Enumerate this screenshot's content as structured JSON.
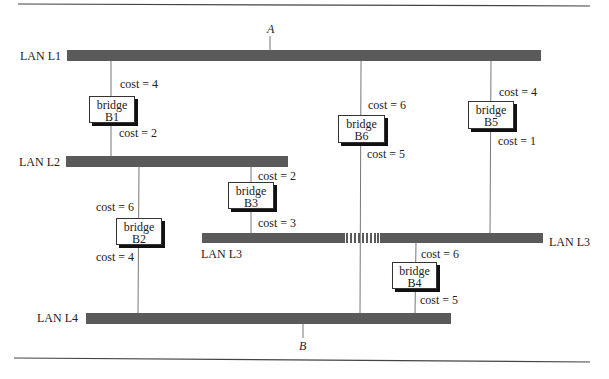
{
  "diagram": {
    "endpoints": {
      "a": "A",
      "b": "B"
    },
    "lans": [
      {
        "id": "L1",
        "label": "LAN L1"
      },
      {
        "id": "L2",
        "label": "LAN L2"
      },
      {
        "id": "L3",
        "label": "LAN L3",
        "label_left": "LAN L3",
        "label_right": "LAN L3"
      },
      {
        "id": "L4",
        "label": "LAN L4"
      }
    ],
    "bridges": [
      {
        "id": "B1",
        "word": "bridge",
        "name": "B1",
        "cost_top": "cost = 4",
        "cost_bottom": "cost = 2",
        "connects": [
          "L1",
          "L2"
        ]
      },
      {
        "id": "B2",
        "word": "bridge",
        "name": "B2",
        "cost_top": "cost = 6",
        "cost_bottom": "cost = 4",
        "connects": [
          "L2",
          "L4"
        ]
      },
      {
        "id": "B3",
        "word": "bridge",
        "name": "B3",
        "cost_top": "cost = 2",
        "cost_bottom": "cost = 3",
        "connects": [
          "L2",
          "L3"
        ]
      },
      {
        "id": "B4",
        "word": "bridge",
        "name": "B4",
        "cost_top": "cost = 6",
        "cost_bottom": "cost = 5",
        "connects": [
          "L3",
          "L4"
        ]
      },
      {
        "id": "B5",
        "word": "bridge",
        "name": "B5",
        "cost_top": "cost = 4",
        "cost_bottom": "cost = 1",
        "connects": [
          "L1",
          "L3"
        ]
      },
      {
        "id": "B6",
        "word": "bridge",
        "name": "B6",
        "cost_top": "cost = 6",
        "cost_bottom": "cost = 5",
        "connects": [
          "L1",
          "L4"
        ]
      }
    ],
    "colors": {
      "lan_bar": "#5a5a5a",
      "line": "#777777",
      "rule": "#444444"
    }
  }
}
